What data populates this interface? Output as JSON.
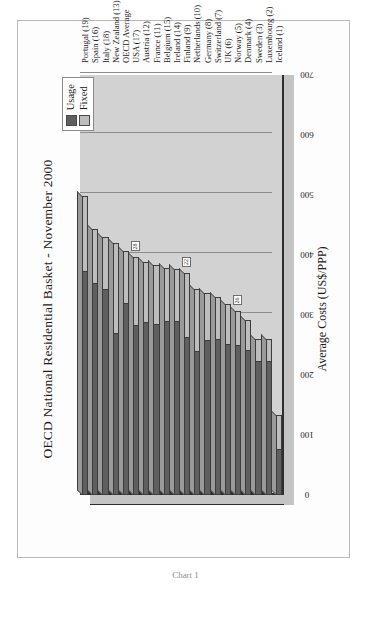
{
  "figure": {
    "title": "OECD National Residential Basket - November 2000",
    "caption": "Chart 1"
  },
  "legend": {
    "position": "top-right",
    "items": [
      {
        "label": "Usage",
        "color": "#5f5f5f"
      },
      {
        "label": "Fixed",
        "color": "#bdbdbd"
      }
    ]
  },
  "axes": {
    "value_axis_title": "Average Costs (US$/PPP)",
    "value_ticks": [
      "0",
      "100",
      "200",
      "300",
      "400",
      "500",
      "600",
      "700"
    ]
  },
  "callouts": [
    {
      "text": "28"
    },
    {
      "text": "22"
    },
    {
      "text": "26"
    }
  ],
  "chart_data": {
    "type": "bar",
    "orientation": "horizontal-stacked",
    "title": "OECD National Residential Basket - November 2000",
    "subtitle": "",
    "xlabel": "",
    "ylabel": "Average Costs (US$/PPP)",
    "ylim": [
      0,
      700
    ],
    "grid": true,
    "legend_position": "top-right",
    "categories": [
      "Iceland (1)",
      "Luxembourg (2)",
      "Sweden (3)",
      "Denmark (4)",
      "Norway (5)",
      "UK (6)",
      "Switzerland (7)",
      "Germany (8)",
      "Netherlands (10)",
      "Finland (9)",
      "Ireland (14)",
      "Belgium (15)",
      "France (11)",
      "Austria (12)",
      "USA (17)",
      "OECD Average",
      "New Zealand (13)",
      "Italy (18)",
      "Spain (16)",
      "Portugal (19)"
    ],
    "series": [
      {
        "name": "Usage",
        "color": "#5f5f5f",
        "values": [
          75,
          222,
          222,
          240,
          248,
          250,
          258,
          256,
          238,
          262,
          288,
          288,
          284,
          286,
          282,
          318,
          268,
          342,
          352,
          372
        ]
      },
      {
        "name": "Fixed",
        "color": "#bdbdbd",
        "values": [
          58,
          38,
          38,
          52,
          58,
          68,
          72,
          80,
          106,
          108,
          88,
          90,
          100,
          102,
          114,
          88,
          152,
          88,
          92,
          126
        ]
      }
    ],
    "totals": [
      133,
      260,
      260,
      292,
      306,
      318,
      330,
      336,
      344,
      370,
      376,
      378,
      384,
      388,
      396,
      406,
      420,
      430,
      444,
      498
    ]
  }
}
